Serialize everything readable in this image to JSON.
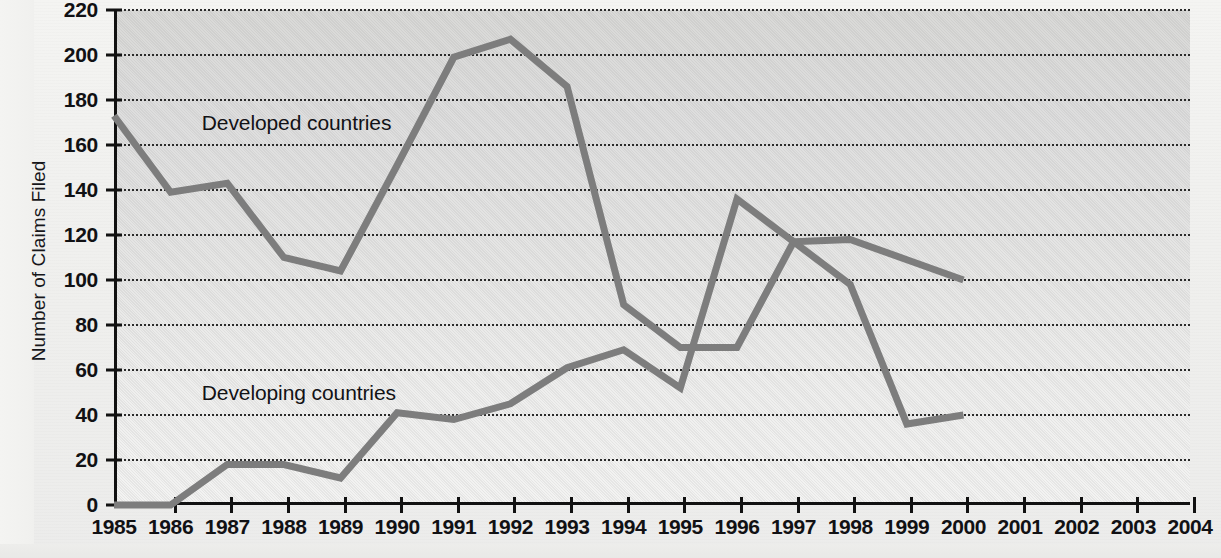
{
  "chart_data": {
    "type": "line",
    "title": "",
    "xlabel": "",
    "ylabel": "Number of Claims Filed",
    "x": [
      1985,
      1986,
      1987,
      1988,
      1989,
      1990,
      1991,
      1992,
      1993,
      1994,
      1995,
      1996,
      1997,
      1998,
      1999,
      2000,
      2001,
      2002,
      2003,
      2004
    ],
    "xtick_labels": [
      "1985",
      "1986",
      "1987",
      "1988",
      "1989",
      "1990",
      "1991",
      "1992",
      "1993",
      "1994",
      "1995",
      "1996",
      "1997",
      "1998",
      "1999",
      "2000",
      "2001",
      "2002",
      "2003",
      "2004"
    ],
    "xlim": [
      1985,
      2004
    ],
    "ylim": [
      0,
      220
    ],
    "ytick_labels": [
      "0",
      "20",
      "40",
      "60",
      "80",
      "100",
      "120",
      "140",
      "160",
      "180",
      "200",
      "220"
    ],
    "ytick_values": [
      0,
      20,
      40,
      60,
      80,
      100,
      120,
      140,
      160,
      180,
      200,
      220
    ],
    "grid": "horizontal-dotted",
    "legend": "inline-annotations",
    "series": [
      {
        "name": "Developed countries",
        "color": "#7d7d7d",
        "x": [
          1985,
          1986,
          1987,
          1988,
          1989,
          1990,
          1991,
          1992,
          1993,
          1994,
          1995,
          1996,
          1997,
          1998,
          1999,
          2000
        ],
        "values": [
          173,
          139,
          143,
          110,
          104,
          151,
          199,
          207,
          186,
          89,
          70,
          70,
          117,
          98,
          36,
          40
        ]
      },
      {
        "name": "Developing countries",
        "color": "#7d7d7d",
        "x": [
          1985,
          1986,
          1987,
          1988,
          1989,
          1990,
          1991,
          1992,
          1993,
          1994,
          1995,
          1996,
          1997,
          1998,
          1999,
          2000
        ],
        "values": [
          0,
          0,
          18,
          18,
          12,
          41,
          38,
          45,
          61,
          69,
          52,
          136,
          117,
          118,
          109,
          100
        ]
      }
    ],
    "annotations": [
      {
        "text": "Developed countries",
        "x": 1986.55,
        "y": 170
      },
      {
        "text": "Developing countries",
        "x": 1986.55,
        "y": 50
      }
    ]
  },
  "axis": {
    "y_title": "Number of Claims Filed"
  }
}
